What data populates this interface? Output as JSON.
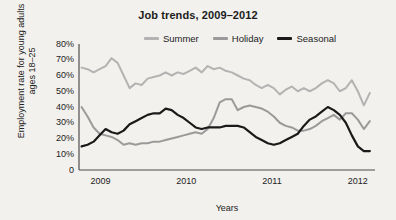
{
  "chart_data": {
    "type": "line",
    "title": "Job trends, 2009–2012",
    "xlabel": "Years",
    "ylabel": "Employment rate for young adults ages 18–25",
    "ylim": [
      0,
      80
    ],
    "xlim": [
      2008.75,
      2012.2
    ],
    "grid": false,
    "legend_position": "top-center",
    "ytick_labels": [
      "0",
      "10%",
      "20%",
      "30%",
      "40%",
      "50%",
      "60%",
      "70%",
      "80%"
    ],
    "ytick_values": [
      0,
      10,
      20,
      30,
      40,
      50,
      60,
      70,
      80
    ],
    "xtick_labels": [
      "2009",
      "2010",
      "2011",
      "2012"
    ],
    "xtick_values": [
      2009,
      2010,
      2011,
      2012
    ],
    "colors": {
      "summer": "#b3b3b3",
      "holiday": "#9a9a9a",
      "seasonal": "#1a1a1a",
      "axis": "#4d4d4d",
      "background": "#f2f1ed"
    },
    "series": [
      {
        "name": "Summer",
        "color": "#b3b3b3",
        "width": 2.0,
        "x": [
          2008.78,
          2008.85,
          2008.92,
          2008.99,
          2009.06,
          2009.13,
          2009.2,
          2009.27,
          2009.34,
          2009.41,
          2009.48,
          2009.55,
          2009.62,
          2009.69,
          2009.76,
          2009.83,
          2009.9,
          2009.97,
          2010.04,
          2010.11,
          2010.18,
          2010.25,
          2010.32,
          2010.39,
          2010.46,
          2010.53,
          2010.6,
          2010.67,
          2010.74,
          2010.81,
          2010.88,
          2010.95,
          2011.02,
          2011.09,
          2011.16,
          2011.23,
          2011.3,
          2011.37,
          2011.44,
          2011.51,
          2011.58,
          2011.65,
          2011.72,
          2011.79,
          2011.86,
          2011.93,
          2012.0,
          2012.07,
          2012.14
        ],
        "y": [
          65,
          64,
          62,
          64,
          66,
          71,
          68,
          60,
          52,
          55,
          54,
          58,
          59,
          60,
          62,
          60,
          62,
          61,
          63,
          65,
          62,
          66,
          64,
          65,
          63,
          62,
          60,
          58,
          57,
          54,
          52,
          54,
          52,
          48,
          51,
          53,
          50,
          52,
          50,
          52,
          55,
          57,
          55,
          50,
          52,
          57,
          50,
          41,
          49
        ]
      },
      {
        "name": "Holiday",
        "color": "#9a9a9a",
        "width": 2.0,
        "x": [
          2008.78,
          2008.85,
          2008.92,
          2008.99,
          2009.06,
          2009.13,
          2009.2,
          2009.27,
          2009.34,
          2009.41,
          2009.48,
          2009.55,
          2009.62,
          2009.69,
          2009.76,
          2009.83,
          2009.9,
          2009.97,
          2010.04,
          2010.11,
          2010.18,
          2010.25,
          2010.32,
          2010.39,
          2010.46,
          2010.53,
          2010.6,
          2010.67,
          2010.74,
          2010.81,
          2010.88,
          2010.95,
          2011.02,
          2011.09,
          2011.16,
          2011.23,
          2011.3,
          2011.37,
          2011.44,
          2011.51,
          2011.58,
          2011.65,
          2011.72,
          2011.79,
          2011.86,
          2011.93,
          2012.0,
          2012.07,
          2012.14
        ],
        "y": [
          40,
          34,
          27,
          23,
          22,
          21,
          19,
          16,
          17,
          16,
          17,
          17,
          18,
          18,
          19,
          20,
          21,
          22,
          23,
          24,
          23,
          26,
          33,
          43,
          45,
          45,
          38,
          40,
          41,
          40,
          39,
          37,
          34,
          30,
          28,
          27,
          25,
          25,
          26,
          28,
          31,
          33,
          35,
          32,
          36,
          36,
          32,
          26,
          31
        ]
      },
      {
        "name": "Seasonal",
        "color": "#1a1a1a",
        "width": 2.2,
        "x": [
          2008.78,
          2008.85,
          2008.92,
          2008.99,
          2009.06,
          2009.13,
          2009.2,
          2009.27,
          2009.34,
          2009.41,
          2009.48,
          2009.55,
          2009.62,
          2009.69,
          2009.76,
          2009.83,
          2009.9,
          2009.97,
          2010.04,
          2010.11,
          2010.18,
          2010.25,
          2010.32,
          2010.39,
          2010.46,
          2010.53,
          2010.6,
          2010.67,
          2010.74,
          2010.81,
          2010.88,
          2010.95,
          2011.02,
          2011.09,
          2011.16,
          2011.23,
          2011.3,
          2011.37,
          2011.44,
          2011.51,
          2011.58,
          2011.65,
          2011.72,
          2011.79,
          2011.86,
          2011.93,
          2012.0,
          2012.07,
          2012.14
        ],
        "y": [
          15,
          16,
          18,
          22,
          26,
          24,
          23,
          25,
          29,
          31,
          33,
          35,
          36,
          36,
          39,
          38,
          35,
          33,
          30,
          27,
          26,
          27,
          27,
          27,
          28,
          28,
          28,
          27,
          24,
          21,
          19,
          17,
          16,
          17,
          19,
          21,
          23,
          28,
          32,
          34,
          37,
          40,
          38,
          35,
          30,
          22,
          15,
          12,
          12
        ]
      }
    ]
  },
  "legend": {
    "items": [
      {
        "label": "Summer",
        "color": "#b3b3b3"
      },
      {
        "label": "Holiday",
        "color": "#9a9a9a"
      },
      {
        "label": "Seasonal",
        "color": "#1a1a1a"
      }
    ]
  }
}
